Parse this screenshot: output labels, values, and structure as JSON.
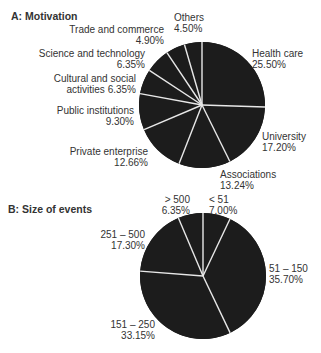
{
  "chart_data": [
    {
      "type": "pie",
      "title": "A: Motivation",
      "start": "12 o'clock, clockwise",
      "categories": [
        "Health care",
        "University",
        "Associations",
        "Private enterprise",
        "Public institutions",
        "Cultural and social activities",
        "Science and technology",
        "Trade and commerce",
        "Others"
      ],
      "values": [
        25.5,
        17.2,
        13.24,
        12.66,
        9.3,
        6.35,
        6.35,
        4.9,
        4.5
      ],
      "labels": [
        {
          "name": "Health care",
          "value": "25.50%"
        },
        {
          "name": "University",
          "value": "17.20%"
        },
        {
          "name": "Associations",
          "value": "13.24%"
        },
        {
          "name": "Private enterprise",
          "value": "12.66%"
        },
        {
          "name": "Public institutions",
          "value": "9.30%"
        },
        {
          "name": "Cultural and social",
          "name2": "activities 6.35%"
        },
        {
          "name": "Science and technology",
          "value": "6.35%"
        },
        {
          "name": "Trade and commerce",
          "value": "4.90%"
        },
        {
          "name": "Others",
          "value": "4.50%"
        }
      ]
    },
    {
      "type": "pie",
      "title": "B: Size of events",
      "start": "12 o'clock, clockwise",
      "categories": [
        "< 51",
        "51 – 150",
        "151 – 250",
        "251 – 500",
        "> 500"
      ],
      "values": [
        7.0,
        35.7,
        33.15,
        17.3,
        6.35
      ],
      "labels": [
        {
          "name": "< 51",
          "value": "7.00%"
        },
        {
          "name": "51 – 150",
          "value": "35.70%"
        },
        {
          "name": "151 – 250",
          "value": "33.15%"
        },
        {
          "name": "251 – 500",
          "value": "17.30%"
        },
        {
          "name": "> 500",
          "value": "6.35%"
        }
      ]
    }
  ],
  "colors": {
    "slice": "#1c1c1c",
    "separator": "#e8e8e8",
    "text": "#333333"
  }
}
